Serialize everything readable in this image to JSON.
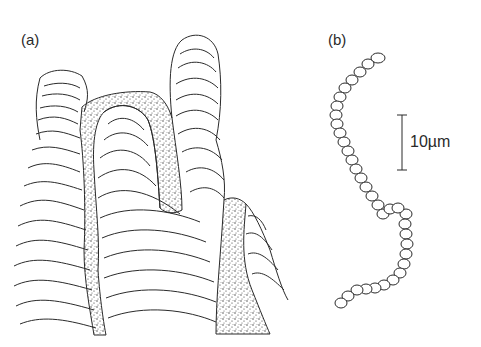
{
  "panels": {
    "a": {
      "label": "(a)",
      "description": "Layered stromatolite-like columnar structure with stippled infill between columns"
    },
    "b": {
      "label": "(b)",
      "description": "Chain of segmented cells (filament)"
    }
  },
  "scale_bar": {
    "label": "10µm",
    "value": 10,
    "unit": "µm"
  },
  "colors": {
    "line": "#2a2a2a",
    "background": "#ffffff"
  }
}
